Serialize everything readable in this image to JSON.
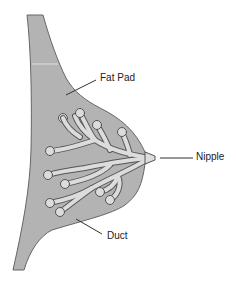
{
  "diagram": {
    "labels": {
      "fat_pad": "Fat Pad",
      "nipple": "Nipple",
      "duct": "Duct"
    },
    "colors": {
      "tissue": "#b3b3b3",
      "duct_fill": "#dcdcdc",
      "outline": "#555555",
      "text": "#222222"
    }
  }
}
